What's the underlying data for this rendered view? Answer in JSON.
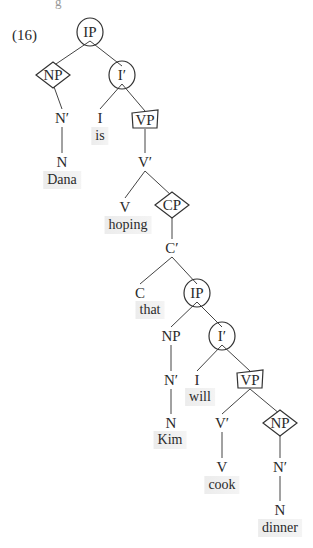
{
  "example": {
    "number": "(16)"
  },
  "top_fragment": "g",
  "colors": {
    "ink": "#2a2a2a",
    "highlight": "#ececec",
    "pen": "#333333"
  },
  "chart_data": {
    "type": "syntax-tree",
    "nodes": [
      {
        "id": "ip1",
        "label": "IP",
        "x": 90,
        "y": 32,
        "mark": "circle"
      },
      {
        "id": "np1",
        "label": "NP",
        "x": 53,
        "y": 75,
        "mark": "diamond"
      },
      {
        "id": "ib1",
        "label": "I′",
        "x": 122,
        "y": 75,
        "mark": "circle"
      },
      {
        "id": "nb1",
        "label": "N′",
        "x": 62,
        "y": 118
      },
      {
        "id": "i1",
        "label": "I",
        "x": 100,
        "y": 118
      },
      {
        "id": "vp1",
        "label": "VP",
        "x": 145,
        "y": 120,
        "mark": "box"
      },
      {
        "id": "n1",
        "label": "N",
        "x": 62,
        "y": 162
      },
      {
        "id": "vb1",
        "label": "V′",
        "x": 145,
        "y": 162
      },
      {
        "id": "v1",
        "label": "V",
        "x": 125,
        "y": 207
      },
      {
        "id": "cp1",
        "label": "CP",
        "x": 172,
        "y": 205,
        "mark": "diamond"
      },
      {
        "id": "cb1",
        "label": "C′",
        "x": 172,
        "y": 248
      },
      {
        "id": "c1",
        "label": "C",
        "x": 140,
        "y": 293
      },
      {
        "id": "ip2",
        "label": "IP",
        "x": 197,
        "y": 293,
        "mark": "circle"
      },
      {
        "id": "np2",
        "label": "NP",
        "x": 171,
        "y": 336
      },
      {
        "id": "ib2",
        "label": "I′",
        "x": 222,
        "y": 336,
        "mark": "circle"
      },
      {
        "id": "nb2",
        "label": "N′",
        "x": 171,
        "y": 380
      },
      {
        "id": "i2",
        "label": "I",
        "x": 197,
        "y": 380
      },
      {
        "id": "vp2",
        "label": "VP",
        "x": 250,
        "y": 380,
        "mark": "box"
      },
      {
        "id": "n2",
        "label": "N",
        "x": 171,
        "y": 423
      },
      {
        "id": "vb2",
        "label": "V′",
        "x": 222,
        "y": 423
      },
      {
        "id": "np3",
        "label": "NP",
        "x": 280,
        "y": 423,
        "mark": "diamond"
      },
      {
        "id": "v2",
        "label": "V",
        "x": 222,
        "y": 467
      },
      {
        "id": "nb3",
        "label": "N′",
        "x": 280,
        "y": 467
      },
      {
        "id": "n3",
        "label": "N",
        "x": 280,
        "y": 510
      }
    ],
    "words": [
      {
        "text": "Dana",
        "x": 62,
        "y": 180
      },
      {
        "text": "is",
        "x": 100,
        "y": 136
      },
      {
        "text": "hoping",
        "x": 128,
        "y": 225
      },
      {
        "text": "that",
        "x": 150,
        "y": 310
      },
      {
        "text": "will",
        "x": 200,
        "y": 397
      },
      {
        "text": "Kim",
        "x": 170,
        "y": 440
      },
      {
        "text": "cook",
        "x": 222,
        "y": 485
      },
      {
        "text": "dinner",
        "x": 280,
        "y": 528
      }
    ],
    "edges": [
      [
        "ip1",
        "np1"
      ],
      [
        "ip1",
        "ib1"
      ],
      [
        "np1",
        "nb1"
      ],
      [
        "nb1",
        "n1"
      ],
      [
        "ib1",
        "i1"
      ],
      [
        "ib1",
        "vp1"
      ],
      [
        "vp1",
        "vb1"
      ],
      [
        "vb1",
        "v1"
      ],
      [
        "vb1",
        "cp1"
      ],
      [
        "cp1",
        "cb1"
      ],
      [
        "cb1",
        "c1"
      ],
      [
        "cb1",
        "ip2"
      ],
      [
        "ip2",
        "np2"
      ],
      [
        "ip2",
        "ib2"
      ],
      [
        "np2",
        "nb2"
      ],
      [
        "nb2",
        "n2"
      ],
      [
        "ib2",
        "i2"
      ],
      [
        "ib2",
        "vp2"
      ],
      [
        "vp2",
        "vb2"
      ],
      [
        "vp2",
        "np3"
      ],
      [
        "vb2",
        "v2"
      ],
      [
        "np3",
        "nb3"
      ],
      [
        "nb3",
        "n3"
      ]
    ]
  }
}
